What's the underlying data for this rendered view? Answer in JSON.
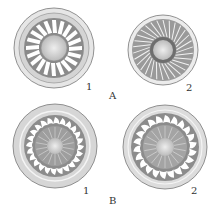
{
  "figure": {
    "panels": [
      {
        "group": "A",
        "index": "1",
        "type": "disc-radial-elements",
        "cx": 54,
        "cy": 48,
        "r": 40
      },
      {
        "group": "A",
        "index": "2",
        "type": "disc-radial-striae",
        "cx": 163,
        "cy": 50,
        "r": 35
      },
      {
        "group": "B",
        "index": "1",
        "type": "disc-hook-elements",
        "cx": 55,
        "cy": 146,
        "r": 42
      },
      {
        "group": "B",
        "index": "2",
        "type": "disc-hook-elements",
        "cx": 165,
        "cy": 147,
        "r": 42
      }
    ],
    "labels": {
      "a1": "1",
      "a2": "2",
      "group_a": "A",
      "b1": "1",
      "b2": "2",
      "group_b": "B"
    },
    "colors": {
      "ink": "#555555",
      "fill": "#d9d9d9",
      "background": "#ffffff"
    }
  }
}
